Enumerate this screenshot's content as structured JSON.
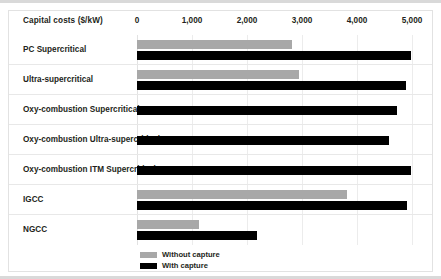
{
  "chart_data": {
    "type": "bar",
    "orientation": "horizontal",
    "title": "",
    "xlabel": "Capital costs ($/kW)",
    "ylabel": "",
    "xlim": [
      0,
      5000
    ],
    "xticks": [
      0,
      1000,
      2000,
      3000,
      4000,
      5000
    ],
    "xticklabels": [
      "0",
      "1,000",
      "2,000",
      "3,000",
      "4,000",
      "5,000"
    ],
    "grid": true,
    "legend_position": "bottom",
    "categories": [
      "PC Supercritical",
      "Ultra-supercritical",
      "Oxy-combustion Supercritical",
      "Oxy-combustion Ultra-supercritical",
      "Oxy-combustion ITM Supercritical",
      "IGCC",
      "NGCC"
    ],
    "series": [
      {
        "name": "Without capture",
        "color": "#a8a8a8",
        "values": [
          2820,
          2950,
          null,
          null,
          null,
          3820,
          1120
        ]
      },
      {
        "name": "With capture",
        "color": "#000000",
        "values": [
          4980,
          4890,
          4720,
          4580,
          4980,
          4900,
          2180
        ]
      }
    ]
  },
  "legend": {
    "items": [
      {
        "label": "Without capture",
        "color": "#a8a8a8"
      },
      {
        "label": "With capture",
        "color": "#000000"
      }
    ]
  }
}
